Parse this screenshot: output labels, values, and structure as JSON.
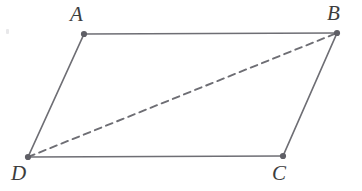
{
  "figure": {
    "kind": "geometry-diagram",
    "shape_name": "parallelogram",
    "canvas": {
      "width": 362,
      "height": 191,
      "background": "#ffffff"
    },
    "style": {
      "stroke_color": "#6e6e74",
      "stroke_width": 1.7,
      "dash_color": "#6e6e74",
      "dash_width": 1.9,
      "dash_pattern": "7 5",
      "vertex_dot_color": "#5f5f66",
      "vertex_dot_radius": 3.1,
      "label_color": "#3d3d3d"
    },
    "vertices": [
      {
        "id": "A",
        "label": "A",
        "x": 84,
        "y": 34,
        "label_x": 70,
        "label_y": 4
      },
      {
        "id": "B",
        "label": "B",
        "x": 337,
        "y": 33,
        "label_x": 327,
        "label_y": 3
      },
      {
        "id": "C",
        "label": "C",
        "x": 283,
        "y": 156,
        "label_x": 272,
        "label_y": 163
      },
      {
        "id": "D",
        "label": "D",
        "x": 28,
        "y": 157,
        "label_x": 11,
        "label_y": 163
      }
    ],
    "edges": [
      {
        "id": "AB",
        "from": "A",
        "to": "B",
        "style": "solid",
        "name": "edge-ab-top"
      },
      {
        "id": "BC",
        "from": "B",
        "to": "C",
        "style": "solid",
        "name": "edge-bc-right"
      },
      {
        "id": "CD",
        "from": "C",
        "to": "D",
        "style": "solid",
        "name": "edge-cd-bottom"
      },
      {
        "id": "DA",
        "from": "D",
        "to": "A",
        "style": "solid",
        "name": "edge-da-left"
      }
    ],
    "diagonals": [
      {
        "id": "DB",
        "from": "D",
        "to": "B",
        "style": "dashed",
        "name": "diagonal-db"
      }
    ],
    "artifacts": [
      {
        "id": "speck-1",
        "x": 6,
        "y": 29
      }
    ]
  }
}
